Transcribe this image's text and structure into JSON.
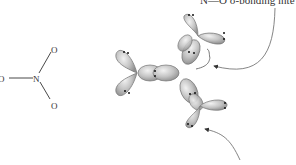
{
  "lewis_structure": {
    "center_atom": "N",
    "outer_atoms": [
      "O",
      "O",
      "O"
    ]
  },
  "orbital_diagram": {
    "description": "NO3- sp2 hybrid orbital overlap diagram",
    "lone_pair_symbol": "••",
    "lobe_fill": "#b8b8b8",
    "lobe_stroke": "#777777"
  },
  "annotations": {
    "top_label": "N—O σ-bonding inte",
    "arrow_color": "#666666"
  }
}
